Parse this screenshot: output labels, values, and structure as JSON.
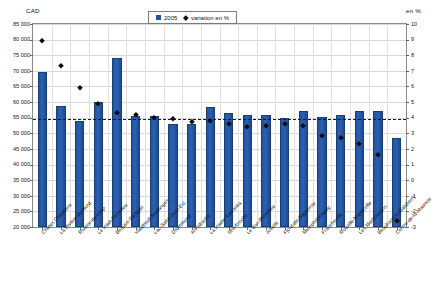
{
  "chart_data": {
    "type": "bar",
    "title": "",
    "subtitle": "",
    "ylabel": "CAD",
    "y2label": "en %",
    "xlabel": "",
    "ylim": [
      20000,
      85000
    ],
    "y2lim": [
      -3,
      10
    ],
    "ytick_step": 5000,
    "y2tick_step": 1,
    "grid": true,
    "legend_position": "top-center",
    "reference_line": {
      "axis": "right",
      "value": 3.9,
      "style": "dashed",
      "label": ""
    },
    "categories": [
      "Chutes Chaudière",
      "La Rivière-du-Nord",
      "Rivière-du-Loup",
      "Le Haut-Richelieu",
      "Beauce-Sartigan",
      "Vaudreuil-Soulanges",
      "Lac-Saint-Jean-Est",
      "Drummond",
      "Arthabaska",
      "La Haute-Yamaska",
      "Sherbrooke",
      "Le Bas-Richelieu",
      "Joliette",
      "Fjord-du-Saguenay",
      "Memphrémagog",
      "Francheville",
      "Rouville-Napierville",
      "Les Maskoutains",
      "Beauharnois-Salaberry",
      "Centre-de-la-Mauricie"
    ],
    "series": [
      {
        "name": "2005",
        "type": "bar",
        "axis": "left",
        "color": "#23549f",
        "values": [
          69500,
          58700,
          54100,
          60000,
          74000,
          55700,
          55500,
          53000,
          53100,
          58300,
          56600,
          55900,
          55800,
          54900,
          57300,
          55300,
          55800,
          57000,
          57000,
          48500
        ]
      },
      {
        "name": "variation en %",
        "type": "scatter",
        "axis": "right",
        "color": "#0d0d0d",
        "values": [
          8.9,
          7.3,
          5.9,
          4.9,
          4.3,
          4.2,
          3.95,
          3.9,
          3.7,
          3.8,
          3.6,
          3.4,
          3.5,
          3.6,
          3.5,
          2.8,
          2.7,
          2.3,
          1.6,
          -2.6
        ]
      }
    ],
    "ytick_labels": [
      "85 000",
      "80 000",
      "75 000",
      "70 000",
      "65 000",
      "60 000",
      "55 000",
      "50 000",
      "45 000",
      "40 000",
      "35 000",
      "30 000",
      "25 000",
      "20 000"
    ],
    "y2tick_labels": [
      "10",
      "9",
      "8",
      "7",
      "6",
      "5",
      "4",
      "3",
      "2",
      "1",
      "0",
      "-1",
      "-2",
      "-3"
    ]
  },
  "legend": {
    "items": [
      {
        "label": "2005",
        "marker": "square-icon",
        "color": "#23549f"
      },
      {
        "label": "variation en %",
        "marker": "diamond-icon",
        "color": "#0d0d0d"
      }
    ]
  }
}
